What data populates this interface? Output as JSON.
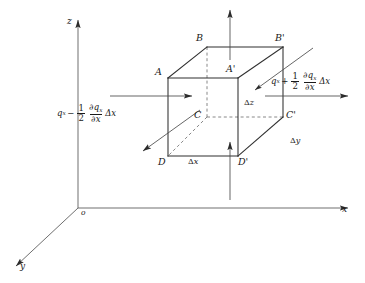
{
  "figure": {
    "type": "technical-diagram",
    "background_color": "#ffffff",
    "line_color": "#3a3a3a",
    "text_color": "#1a1a1a"
  },
  "axes": {
    "z": {
      "label": "z",
      "x": 68,
      "y": 22
    },
    "x": {
      "label": "x",
      "x": 343,
      "y": 212
    },
    "y": {
      "label": "y",
      "x": 20,
      "y": 268
    },
    "origin": {
      "label": "o",
      "x": 82,
      "y": 213
    }
  },
  "cube": {
    "vertices": [
      {
        "name": "A",
        "label": "A",
        "x": 155,
        "y": 73,
        "px": 168,
        "py": 78
      },
      {
        "name": "Ap",
        "label": "A'",
        "x": 228,
        "y": 72,
        "px": 238,
        "py": 78
      },
      {
        "name": "B",
        "label": "B",
        "x": 198,
        "y": 40,
        "px": 207,
        "py": 47
      },
      {
        "name": "Bp",
        "label": "B'",
        "x": 277,
        "y": 40,
        "px": 283,
        "py": 47
      },
      {
        "name": "C",
        "label": "C",
        "x": 196,
        "y": 116,
        "px": 207,
        "py": 117
      },
      {
        "name": "Cp",
        "label": "C'",
        "x": 287,
        "y": 117,
        "px": 283,
        "py": 117
      },
      {
        "name": "D",
        "label": "D",
        "x": 160,
        "y": 163,
        "px": 168,
        "py": 156
      },
      {
        "name": "Dp",
        "label": "D'",
        "x": 240,
        "y": 163,
        "px": 238,
        "py": 156
      }
    ]
  },
  "dimension_labels": [
    {
      "name": "delta-x",
      "symbol": "Δ",
      "variable": "x",
      "x": 190,
      "y": 163
    },
    {
      "name": "delta-y",
      "symbol": "Δ",
      "variable": "y",
      "x": 291,
      "y": 142
    },
    {
      "name": "delta-z",
      "symbol": "Δ",
      "variable": "z",
      "x": 245,
      "y": 104
    }
  ],
  "flux_labels": {
    "left": {
      "name": "flux-in-left",
      "text": "qₓ − ½ ∂qₓ/∂x Δx",
      "base": "q",
      "base_sub": "x",
      "operator": "−",
      "coeff_num": "1",
      "coeff_den": "2",
      "deriv_num": "∂q",
      "deriv_num_sub": "x",
      "deriv_den": "∂x",
      "tail": "Δx",
      "x": 58,
      "y": 108
    },
    "right": {
      "name": "flux-out-right",
      "text": "qₓ + ½ ∂qₓ/∂x Δx",
      "base": "q",
      "base_sub": "x",
      "operator": "+",
      "coeff_num": "1",
      "coeff_den": "2",
      "deriv_num": "∂q",
      "deriv_num_sub": "x",
      "deriv_den": "∂x",
      "tail": "Δx",
      "x": 272,
      "y": 76
    }
  },
  "arrows": [
    {
      "name": "arrow-x-in-left",
      "direction": "right",
      "x1": 110,
      "y1": 96,
      "x2": 196,
      "y2": 96
    },
    {
      "name": "arrow-x-out-right",
      "direction": "right",
      "x1": 265,
      "y1": 96,
      "x2": 352,
      "y2": 96
    },
    {
      "name": "arrow-z-up-top",
      "direction": "up",
      "x1": 230,
      "y1": 60,
      "x2": 230,
      "y2": 8
    },
    {
      "name": "arrow-z-up-bottom",
      "direction": "up",
      "x1": 230,
      "y1": 200,
      "x2": 230,
      "y2": 140
    },
    {
      "name": "arrow-y-out-front",
      "direction": "down-left",
      "x1": 200,
      "y1": 110,
      "x2": 141,
      "y2": 153
    },
    {
      "name": "arrow-y-in-back",
      "direction": "down-left",
      "x1": 313,
      "y1": 48,
      "x2": 253,
      "y2": 92
    }
  ]
}
